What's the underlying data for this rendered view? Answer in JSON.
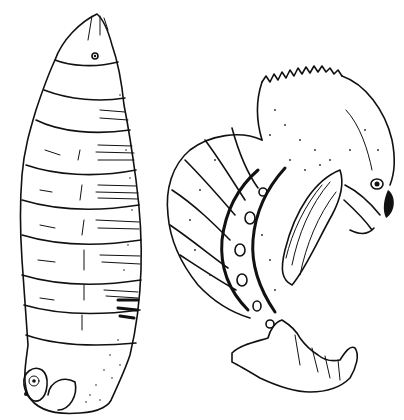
{
  "figure": {
    "colors": {
      "ink": "#111111",
      "paper": "#ffffff"
    },
    "specimens": [
      {
        "id": "larva",
        "position": "left",
        "segments_visible": 10,
        "features": [
          "head-capsule",
          "spiracle-eye",
          "transverse-stripes",
          "anal-spiracle-plate"
        ]
      },
      {
        "id": "pupa",
        "position": "right",
        "features": [
          "toothed-crest",
          "eye",
          "curved-abdomen",
          "spiracle-row",
          "wing-sheath",
          "terminal-spines"
        ]
      }
    ]
  }
}
